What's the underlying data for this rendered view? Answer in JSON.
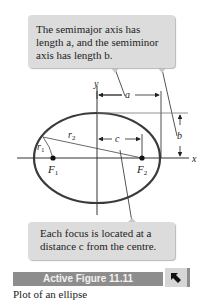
{
  "callouts": {
    "top": {
      "lines": [
        "The semimajor axis has",
        "length a, and the semiminor",
        "axis has length b."
      ]
    },
    "bottom": {
      "lines": [
        "Each focus is located at a",
        "distance c from the centre."
      ]
    }
  },
  "diagram": {
    "axis_labels": {
      "x": "x",
      "y": "y"
    },
    "dimension_labels": {
      "a": "a",
      "b": "b",
      "c": "c"
    },
    "radius_labels": {
      "r1": "r",
      "r1_sub": "1",
      "r2": "r",
      "r2_sub": "2"
    },
    "foci": [
      {
        "label": "F",
        "sub": "1"
      },
      {
        "label": "F",
        "sub": "2"
      }
    ],
    "colors": {
      "ellipse_stroke": "#3a3a3a",
      "axis": "#333333",
      "callout_bg": "#dcdcdc"
    }
  },
  "active_figure": {
    "label": "Active Figure 11.11",
    "button_icon": "arrow-up-left-icon",
    "bar_color": "#8d8d8d"
  },
  "caption": "Plot of an ellipse"
}
